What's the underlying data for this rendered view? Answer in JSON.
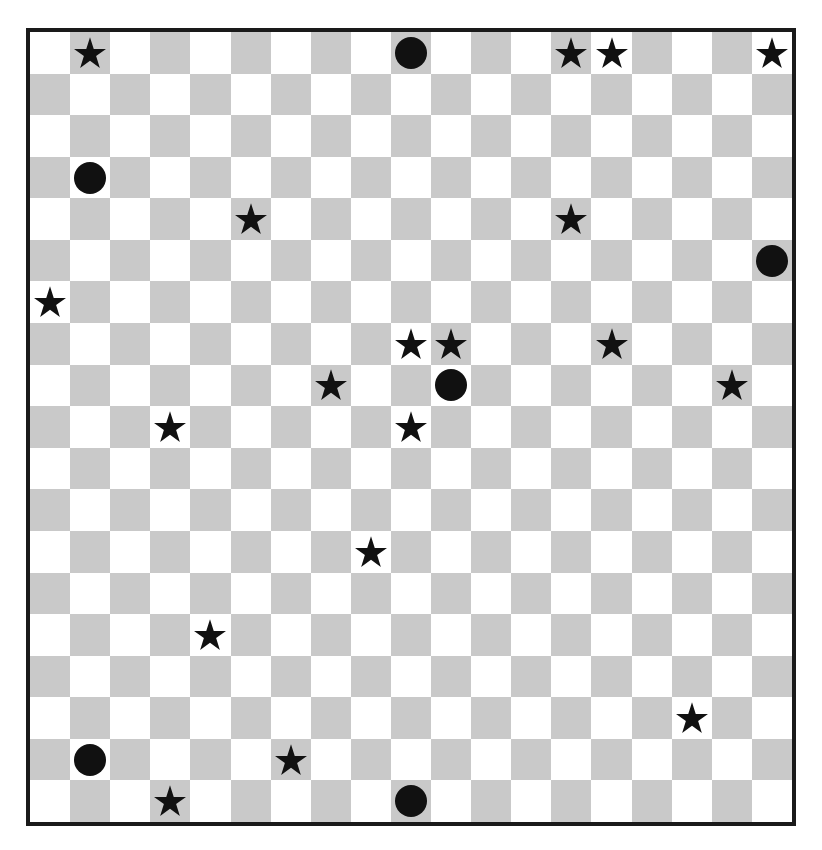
{
  "board": {
    "rows": 19,
    "cols": 19,
    "top_left_color": "light",
    "colors": {
      "light": "#ffffff",
      "dark": "#c9c9c9",
      "piece": "#111111",
      "border": "#1a1a1a"
    },
    "pieces": [
      {
        "row": 0,
        "col": 1,
        "type": "star"
      },
      {
        "row": 0,
        "col": 9,
        "type": "circle"
      },
      {
        "row": 0,
        "col": 13,
        "type": "star"
      },
      {
        "row": 0,
        "col": 14,
        "type": "star"
      },
      {
        "row": 0,
        "col": 18,
        "type": "star"
      },
      {
        "row": 3,
        "col": 1,
        "type": "circle"
      },
      {
        "row": 4,
        "col": 5,
        "type": "star"
      },
      {
        "row": 4,
        "col": 13,
        "type": "star"
      },
      {
        "row": 5,
        "col": 18,
        "type": "circle"
      },
      {
        "row": 6,
        "col": 0,
        "type": "star"
      },
      {
        "row": 7,
        "col": 9,
        "type": "star"
      },
      {
        "row": 7,
        "col": 10,
        "type": "star"
      },
      {
        "row": 7,
        "col": 14,
        "type": "star"
      },
      {
        "row": 8,
        "col": 7,
        "type": "star"
      },
      {
        "row": 8,
        "col": 10,
        "type": "circle"
      },
      {
        "row": 8,
        "col": 17,
        "type": "star"
      },
      {
        "row": 9,
        "col": 3,
        "type": "star"
      },
      {
        "row": 9,
        "col": 9,
        "type": "star"
      },
      {
        "row": 12,
        "col": 8,
        "type": "star"
      },
      {
        "row": 14,
        "col": 4,
        "type": "star"
      },
      {
        "row": 16,
        "col": 16,
        "type": "star"
      },
      {
        "row": 17,
        "col": 1,
        "type": "circle"
      },
      {
        "row": 17,
        "col": 6,
        "type": "star"
      },
      {
        "row": 18,
        "col": 3,
        "type": "star"
      },
      {
        "row": 18,
        "col": 9,
        "type": "circle"
      }
    ],
    "counts": {
      "stars": 18,
      "circles": 6
    }
  }
}
